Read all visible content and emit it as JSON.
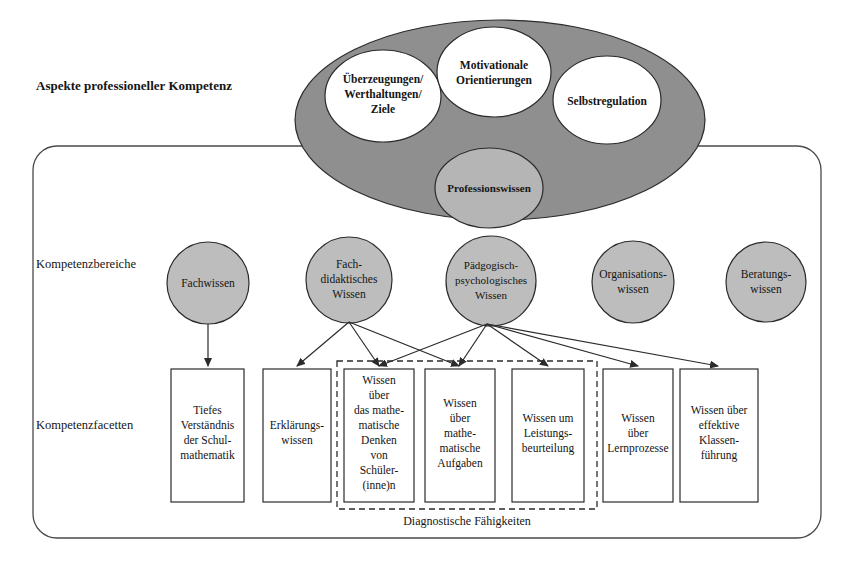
{
  "figure": {
    "row_labels": [
      {
        "id": "aspekte",
        "text": "Aspekte professioneller Kompetenz",
        "bold": true
      },
      {
        "id": "bereiche",
        "text": "Kompetenzbereiche",
        "bold": false
      },
      {
        "id": "facetten",
        "text": "Kompetenzfacetten",
        "bold": false
      }
    ],
    "colors": {
      "outer_ellipse_fill": "#8f8f8f",
      "inner_ellipse_fill": "#ffffff",
      "professionswissen_fill": "#b5b5b5",
      "circle_fill": "#bdbdbd",
      "box_fill": "#ffffff",
      "stroke": "#2b2b2b",
      "page_background": "#ffffff"
    },
    "outer_ellipse": {
      "label": "aspekte-professioneller-kompetenz-ellipse"
    },
    "aspect_ellipses": [
      {
        "id": "ueberzeugungen",
        "lines": [
          "Überzeugungen/",
          "Werthaltungen/",
          "Ziele"
        ]
      },
      {
        "id": "motivationale",
        "lines": [
          "Motivationale",
          "Orientierungen"
        ]
      },
      {
        "id": "selbstregulation",
        "lines": [
          "Selbstregulation"
        ]
      }
    ],
    "professionswissen": {
      "id": "professionswissen",
      "lines": [
        "Professionswissen"
      ]
    },
    "competence_areas": [
      {
        "id": "fachwissen",
        "lines": [
          "Fachwissen"
        ]
      },
      {
        "id": "fachdidaktisches-wissen",
        "lines": [
          "Fach-",
          "didaktisches",
          "Wissen"
        ]
      },
      {
        "id": "paedgogisch-psychologisches-wissen",
        "lines": [
          "Pädgogisch-",
          "psychologisches",
          "Wissen"
        ]
      },
      {
        "id": "organisationswissen",
        "lines": [
          "Organisations-",
          "wissen"
        ]
      },
      {
        "id": "beratungswissen",
        "lines": [
          "Beratungs-",
          "wissen"
        ]
      }
    ],
    "competence_facets": [
      {
        "id": "tiefes-verstaendnis",
        "lines": [
          "Tiefes",
          "Verständnis",
          "der Schul-",
          "mathematik"
        ]
      },
      {
        "id": "erklaerungswissen",
        "lines": [
          "Erklärungs-",
          "wissen"
        ]
      },
      {
        "id": "mathematisches-denken",
        "lines": [
          "Wissen",
          "über",
          "das mathe-",
          "matische",
          "Denken",
          "von",
          "Schüler-",
          "(inne)n"
        ]
      },
      {
        "id": "mathematische-aufgaben",
        "lines": [
          "Wissen",
          "über",
          "mathe-",
          "matische",
          "Aufgaben"
        ]
      },
      {
        "id": "leistungsbeurteilung",
        "lines": [
          "Wissen um",
          "Leistungs-",
          "beurteilung"
        ]
      },
      {
        "id": "lernprozesse",
        "lines": [
          "Wissen",
          "über",
          "Lernprozesse"
        ]
      },
      {
        "id": "klassenfuehrung",
        "lines": [
          "Wissen über",
          "effektive",
          "Klassen-",
          "führung"
        ]
      }
    ],
    "dashed_group": {
      "id": "diagnostische-faehigkeiten",
      "label": "Diagnostische Fähigkeiten"
    }
  }
}
